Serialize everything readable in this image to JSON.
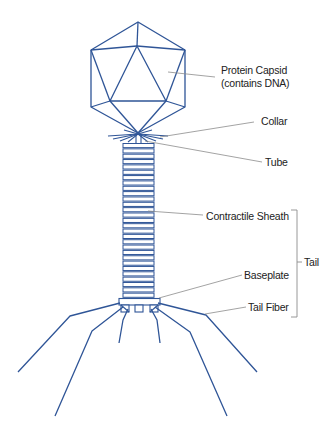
{
  "diagram": {
    "colors": {
      "structure": "#2f5597",
      "leader": "#8c8c8c",
      "text": "#222222"
    },
    "labels": {
      "capsid_line1": "Protein Capsid",
      "capsid_line2": "(contains DNA)",
      "collar": "Collar",
      "tube": "Tube",
      "sheath": "Contractile Sheath",
      "tail": "Tail",
      "baseplate": "Baseplate",
      "tail_fiber": "Tail Fiber"
    },
    "sheath_segments": 29
  }
}
